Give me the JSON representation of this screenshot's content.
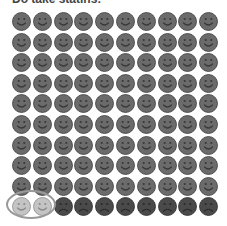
{
  "title": "Do take statins:",
  "icon_array": {
    "rows": 10,
    "cols": 10,
    "total": 100,
    "groups": [
      {
        "name": "unaffected-smile",
        "count": 90,
        "face": "smile",
        "fill": "#6b6b6b",
        "stroke": "#3a3a3a"
      },
      {
        "name": "helped-smile",
        "count": 2,
        "face": "smile",
        "fill": "#c4c4c4",
        "stroke": "#8a8a8a",
        "highlighted": true
      },
      {
        "name": "harmed-sad",
        "count": 8,
        "face": "sad",
        "fill": "#4a4a4a",
        "stroke": "#2a2a2a"
      }
    ],
    "highlight": {
      "shape": "ellipse",
      "color": "#999999",
      "covers": "row 10, columns 1-2"
    }
  }
}
